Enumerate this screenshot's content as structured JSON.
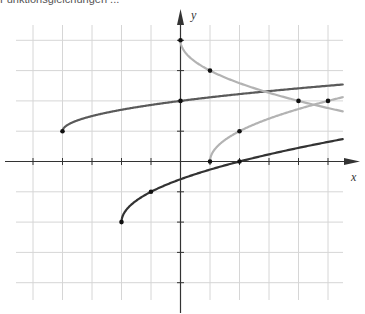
{
  "caption": "Funktionsgleichungen ...",
  "colors": {
    "grid": "#d6d6d6",
    "axis": "#333333",
    "curve_dark": "#333333",
    "curve_mid": "#5a5a5a",
    "curve_light": "#b3b3b3",
    "point": "#111111"
  },
  "chart_data": {
    "type": "line",
    "title": "",
    "xlabel": "x",
    "ylabel": "y",
    "xlim": [
      -5,
      5.5
    ],
    "ylim": [
      -4.5,
      4.5
    ],
    "grid": true,
    "x_ticks": [
      -5,
      -4,
      -3,
      -2,
      -1,
      1,
      2,
      3,
      4,
      5
    ],
    "y_ticks": [
      -4,
      -3,
      -2,
      -1,
      1,
      2,
      3,
      4
    ],
    "series": [
      {
        "name": "curve-upper-mid",
        "color": "#5a5a5a",
        "formula": "sqrt(x+4)/2 + 1",
        "domain": [
          -4,
          5.5
        ],
        "marked_points": [
          [
            -4,
            1
          ],
          [
            0,
            2
          ]
        ]
      },
      {
        "name": "curve-lower-dark",
        "color": "#333333",
        "formula": "sqrt(x+2) - 2",
        "domain": [
          -2,
          5.5
        ],
        "marked_points": [
          [
            -2,
            -2
          ],
          [
            -1,
            -1
          ],
          [
            2,
            0
          ]
        ]
      },
      {
        "name": "curve-light-decreasing",
        "color": "#b3b3b3",
        "formula": "4 - sqrt(x)",
        "domain": [
          0,
          5.5
        ],
        "marked_points": [
          [
            0,
            4
          ],
          [
            1,
            3
          ],
          [
            4,
            2
          ]
        ]
      },
      {
        "name": "curve-light-increasing",
        "color": "#b3b3b3",
        "formula": "sqrt(x-1)",
        "domain": [
          1,
          5.5
        ],
        "marked_points": [
          [
            1,
            0
          ],
          [
            2,
            1
          ],
          [
            5,
            2
          ]
        ]
      }
    ]
  }
}
